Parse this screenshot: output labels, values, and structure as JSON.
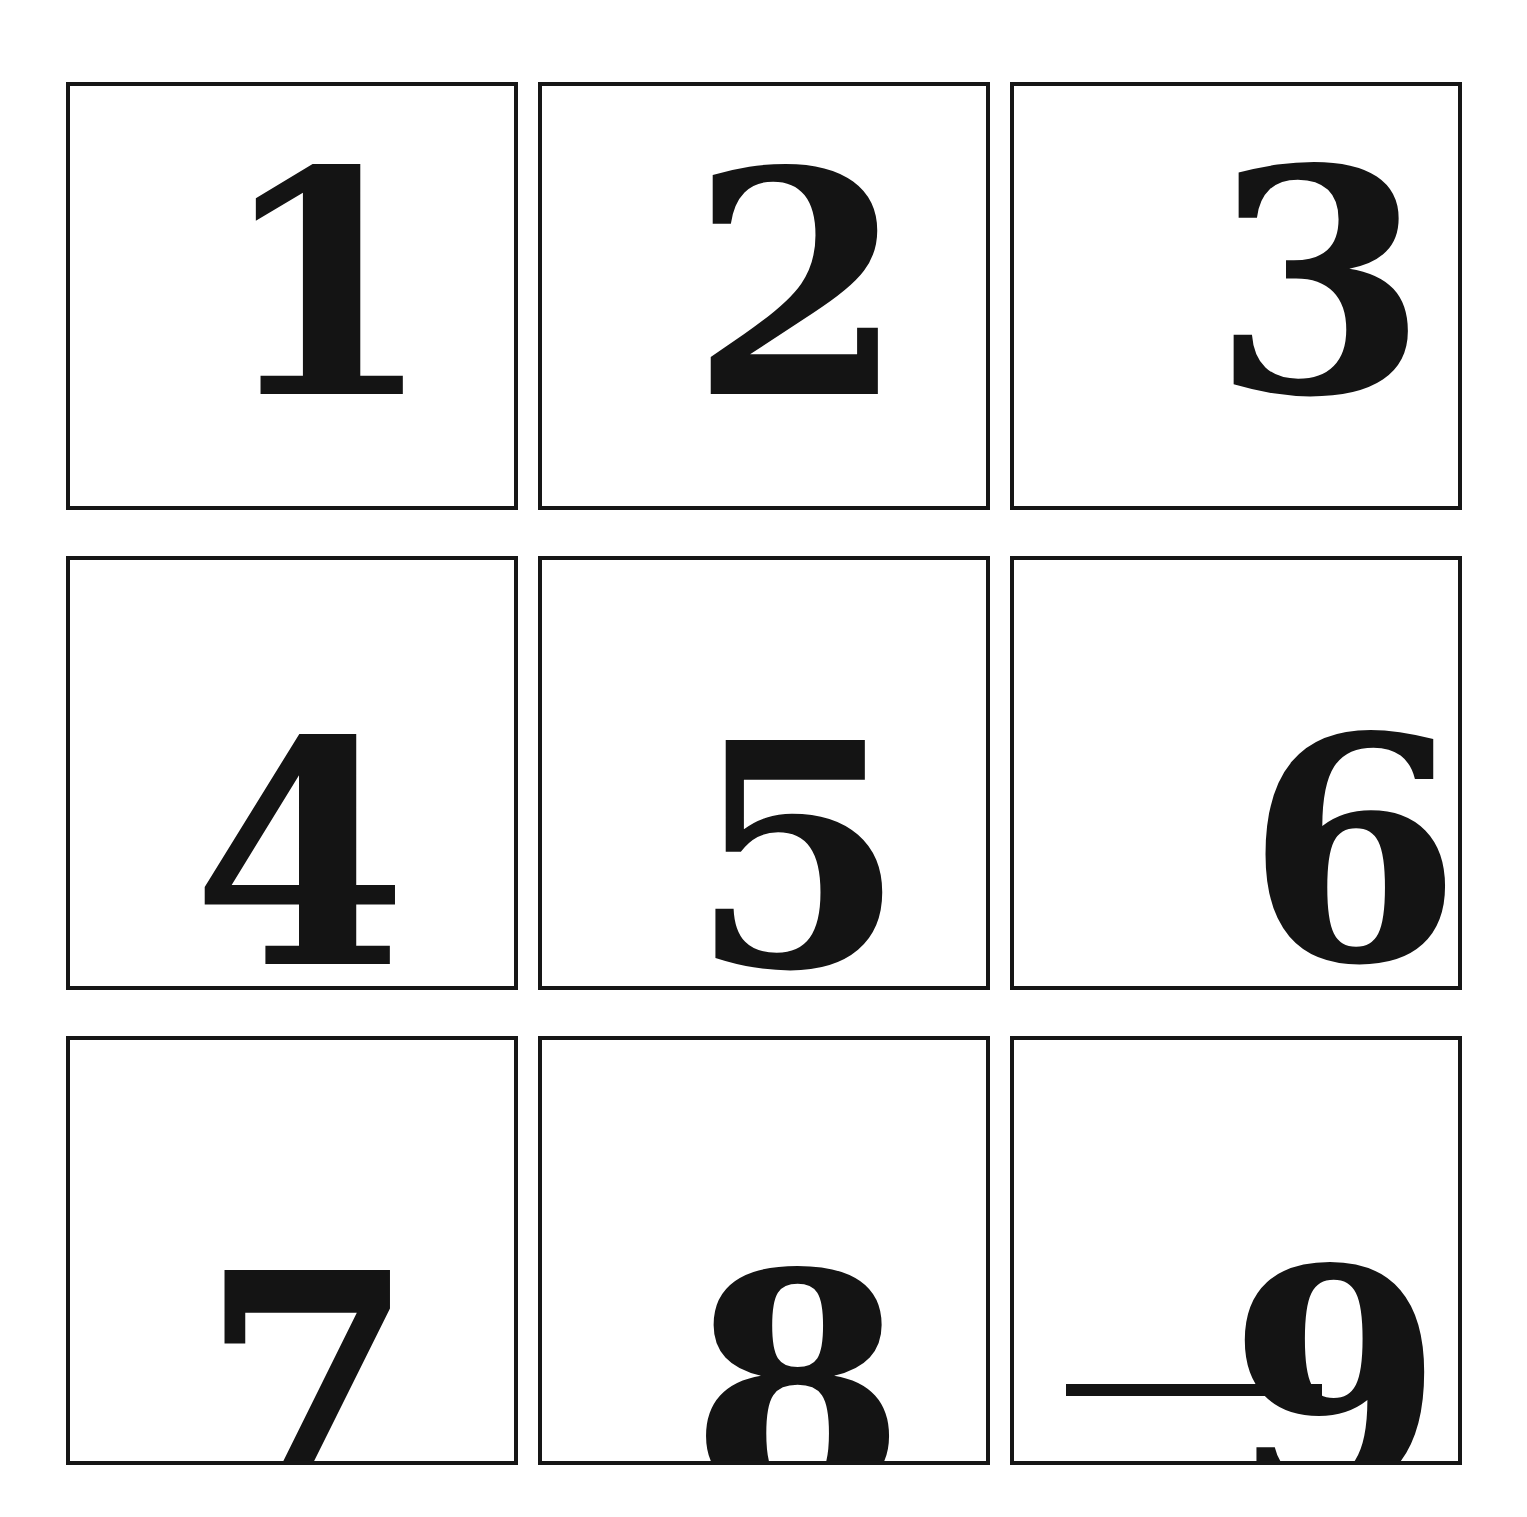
{
  "page": {
    "background_color": "#ffffff",
    "ink_color": "#141414",
    "border_color": "#161616"
  },
  "grid": {
    "rows": 3,
    "columns": 3,
    "cell_border_width_px": 4,
    "cells": [
      {
        "id": "cell-1",
        "value": "1",
        "row": 1,
        "column": 1,
        "underlined": false
      },
      {
        "id": "cell-2",
        "value": "2",
        "row": 1,
        "column": 2,
        "underlined": false
      },
      {
        "id": "cell-3",
        "value": "3",
        "row": 1,
        "column": 3,
        "underlined": false
      },
      {
        "id": "cell-4",
        "value": "4",
        "row": 2,
        "column": 1,
        "underlined": false
      },
      {
        "id": "cell-5",
        "value": "5",
        "row": 2,
        "column": 2,
        "underlined": false
      },
      {
        "id": "cell-6",
        "value": "6",
        "row": 2,
        "column": 3,
        "underlined": false
      },
      {
        "id": "cell-7",
        "value": "7",
        "row": 3,
        "column": 1,
        "underlined": false
      },
      {
        "id": "cell-8",
        "value": "8",
        "row": 3,
        "column": 2,
        "underlined": false
      },
      {
        "id": "cell-9",
        "value": "9",
        "row": 3,
        "column": 3,
        "underlined": true
      }
    ]
  },
  "annotations": {
    "underline_mark_label": "orientation underline beneath the numeral 9"
  }
}
